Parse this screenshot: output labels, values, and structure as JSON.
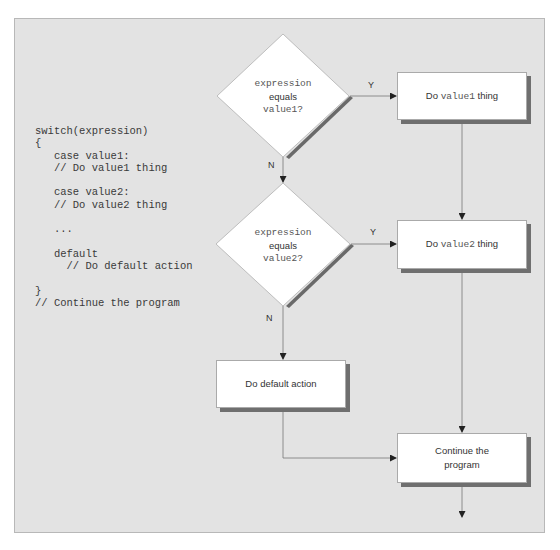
{
  "code_listing": {
    "lines": [
      "switch(expression)",
      "{",
      "   case value1:",
      "   // Do value1 thing",
      "",
      "   case value2:",
      "   // Do value2 thing",
      "",
      "   ...",
      "",
      "   default",
      "     // Do default action",
      "",
      "}",
      "// Continue the program"
    ]
  },
  "flowchart": {
    "decision1": {
      "line1": "expression",
      "line2": "equals",
      "line3": "value1?"
    },
    "decision2": {
      "line1": "expression",
      "line2": "equals",
      "line3": "value2?"
    },
    "box1": {
      "prefix": "Do ",
      "code": "value1",
      "suffix": " thing"
    },
    "box2": {
      "prefix": "Do ",
      "code": "value2",
      "suffix": " thing"
    },
    "box_default": {
      "label": "Do default action"
    },
    "box_continue": {
      "line1": "Continue the",
      "line2": "program"
    },
    "labels": {
      "yes1": "Y",
      "no1": "N",
      "yes2": "Y",
      "no2": "N"
    }
  }
}
